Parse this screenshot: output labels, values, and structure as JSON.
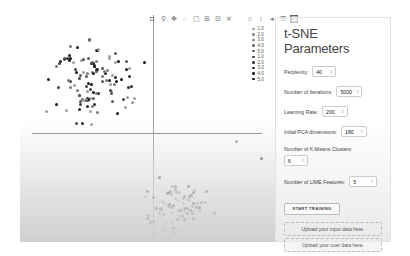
{
  "toolbar": {
    "icons": [
      "camera-icon",
      "zoom-icon",
      "pan-icon",
      "lasso-icon",
      "box-select-icon",
      "zoom-in-icon",
      "zoom-out-icon",
      "autoscale-icon",
      "reset-axes-icon",
      "spike-lines-icon",
      "hover-closest-icon",
      "hover-compare-icon",
      "plotly-logo-icon"
    ]
  },
  "legend": {
    "items": [
      {
        "label": "1.0",
        "color": "#9e9e9e"
      },
      {
        "label": "2.0",
        "color": "#8c8c8c"
      },
      {
        "label": "3.0",
        "color": "#7a7a7a"
      },
      {
        "label": "4.0",
        "color": "#6a6a6a"
      },
      {
        "label": "5.0",
        "color": "#5a5a5a"
      },
      {
        "label": "1.0",
        "color": "#444444"
      },
      {
        "label": "2.0",
        "color": "#3a3a3a"
      },
      {
        "label": "3.0",
        "color": "#303030"
      },
      {
        "label": "4.0",
        "color": "#262626"
      },
      {
        "label": "5.0",
        "color": "#1a1a1a"
      }
    ]
  },
  "panel": {
    "title": "t-SNE Parameters",
    "perplexity": {
      "label": "Perplexity:",
      "value": "40"
    },
    "iterations": {
      "label": "Number of Iterations:",
      "value": "5000"
    },
    "learning_rate": {
      "label": "Learning Rate:",
      "value": "200"
    },
    "pca_dims": {
      "label": "Initial PCA dimensions:",
      "value": "180"
    },
    "kmeans": {
      "label": "Number of K-Means Clusters:",
      "value": "6"
    },
    "lime": {
      "label": "Number of LIME Features:",
      "value": "5"
    },
    "start_button": "START TRAINING",
    "upload_input": "Upload your input data here.",
    "upload_user": "Upload your user data here."
  },
  "chart_data": {
    "type": "scatter",
    "title": "",
    "xlabel": "",
    "ylabel": "",
    "crosshair": {
      "x_px": 153,
      "y_px": 133
    },
    "legend_entries": [
      "1.0",
      "2.0",
      "3.0",
      "4.0",
      "5.0",
      "1.0",
      "2.0",
      "3.0",
      "4.0",
      "5.0"
    ],
    "clusters": [
      {
        "name": "upper-left cluster",
        "approx_center_px": [
          90,
          80
        ],
        "count_approx": 110
      },
      {
        "name": "lower-right cluster",
        "approx_center_px": [
          180,
          205
        ],
        "count_approx": 70
      }
    ]
  }
}
